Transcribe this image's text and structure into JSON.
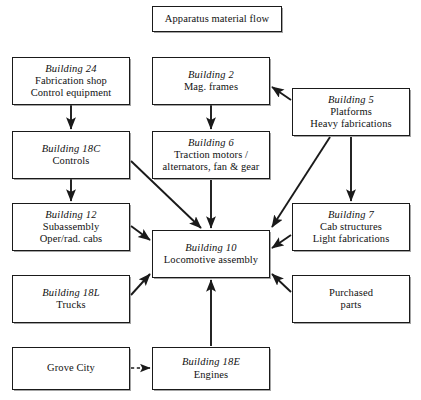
{
  "diagram": {
    "title": "Apparatus material flow",
    "type": "flowchart",
    "background_color": "#ffffff",
    "line_color": "#1a1a1a",
    "nodes": [
      {
        "id": "title",
        "name": "apparatus-material-flow",
        "lines": [
          {
            "text": "Apparatus material flow",
            "style": "plain"
          }
        ],
        "x": 152,
        "y": 6,
        "w": 130,
        "h": 26
      },
      {
        "id": "b24",
        "name": "building-24",
        "lines": [
          {
            "text": "Building 24",
            "style": "italic"
          },
          {
            "text": "Fabrication shop",
            "style": "plain"
          },
          {
            "text": "Control equipment",
            "style": "plain"
          }
        ],
        "x": 12,
        "y": 57,
        "w": 118,
        "h": 48
      },
      {
        "id": "b2",
        "name": "building-2",
        "lines": [
          {
            "text": "Building 2",
            "style": "italic"
          },
          {
            "text": "Mag. frames",
            "style": "plain"
          }
        ],
        "x": 152,
        "y": 57,
        "w": 118,
        "h": 48
      },
      {
        "id": "b5",
        "name": "building-5",
        "lines": [
          {
            "text": "Building 5",
            "style": "italic"
          },
          {
            "text": "Platforms",
            "style": "plain"
          },
          {
            "text": "Heavy fabrications",
            "style": "plain"
          }
        ],
        "x": 292,
        "y": 88,
        "w": 118,
        "h": 48
      },
      {
        "id": "b18c",
        "name": "building-18c",
        "lines": [
          {
            "text": "Building 18C",
            "style": "italic"
          },
          {
            "text": "Controls",
            "style": "plain"
          }
        ],
        "x": 12,
        "y": 131,
        "w": 118,
        "h": 48
      },
      {
        "id": "b6",
        "name": "building-6",
        "lines": [
          {
            "text": "Building 6",
            "style": "italic"
          },
          {
            "text": "Traction motors /",
            "style": "plain"
          },
          {
            "text": "alternators, fan & gear",
            "style": "plain"
          }
        ],
        "x": 152,
        "y": 131,
        "w": 118,
        "h": 48
      },
      {
        "id": "b12",
        "name": "building-12",
        "lines": [
          {
            "text": "Building 12",
            "style": "italic"
          },
          {
            "text": "Subassembly",
            "style": "plain"
          },
          {
            "text": "Oper/rad. cabs",
            "style": "plain"
          }
        ],
        "x": 12,
        "y": 203,
        "w": 118,
        "h": 48
      },
      {
        "id": "b7",
        "name": "building-7",
        "lines": [
          {
            "text": "Building 7",
            "style": "italic"
          },
          {
            "text": "Cab structures",
            "style": "plain"
          },
          {
            "text": "Light fabrications",
            "style": "plain"
          }
        ],
        "x": 292,
        "y": 203,
        "w": 118,
        "h": 48
      },
      {
        "id": "b10",
        "name": "building-10",
        "lines": [
          {
            "text": "Building 10",
            "style": "italic"
          },
          {
            "text": "Locomotive assembly",
            "style": "plain"
          }
        ],
        "x": 152,
        "y": 230,
        "w": 118,
        "h": 48
      },
      {
        "id": "b18l",
        "name": "building-18l",
        "lines": [
          {
            "text": "Building 18L",
            "style": "italic"
          },
          {
            "text": "Trucks",
            "style": "plain"
          }
        ],
        "x": 12,
        "y": 275,
        "w": 118,
        "h": 48
      },
      {
        "id": "purchased",
        "name": "purchased-parts",
        "lines": [
          {
            "text": "Purchased",
            "style": "plain"
          },
          {
            "text": "parts",
            "style": "plain"
          }
        ],
        "x": 292,
        "y": 275,
        "w": 118,
        "h": 48
      },
      {
        "id": "grove",
        "name": "grove-city",
        "lines": [
          {
            "text": "Grove City",
            "style": "plain"
          }
        ],
        "x": 12,
        "y": 347,
        "w": 118,
        "h": 43
      },
      {
        "id": "b18e",
        "name": "building-18e",
        "lines": [
          {
            "text": "Building 18E",
            "style": "italic"
          },
          {
            "text": "Engines",
            "style": "plain"
          }
        ],
        "x": 152,
        "y": 347,
        "w": 118,
        "h": 43
      }
    ],
    "edges": [
      {
        "name": "edge-b24-to-b18c",
        "from": "b24",
        "to": "b18c",
        "style": "solid",
        "points": [
          [
            71,
            105
          ],
          [
            71,
            129
          ]
        ]
      },
      {
        "name": "edge-b2-to-b6",
        "from": "b2",
        "to": "b6",
        "style": "solid",
        "points": [
          [
            211,
            105
          ],
          [
            211,
            129
          ]
        ]
      },
      {
        "name": "edge-b5-to-b2",
        "from": "b5",
        "to": "b2",
        "style": "solid",
        "points": [
          [
            291,
            100
          ],
          [
            272,
            87
          ]
        ]
      },
      {
        "name": "edge-b18c-to-b12",
        "from": "b18c",
        "to": "b12",
        "style": "solid",
        "points": [
          [
            71,
            179
          ],
          [
            71,
            201
          ]
        ]
      },
      {
        "name": "edge-b5-to-b7",
        "from": "b5",
        "to": "b7",
        "style": "solid",
        "points": [
          [
            351,
            137
          ],
          [
            351,
            201
          ]
        ]
      },
      {
        "name": "edge-b18c-to-b10",
        "from": "b18c",
        "to": "b10",
        "style": "solid",
        "points": [
          [
            131,
            161
          ],
          [
            201,
            228
          ]
        ]
      },
      {
        "name": "edge-b5-to-b10",
        "from": "b5",
        "to": "b10",
        "style": "solid",
        "points": [
          [
            330,
            137
          ],
          [
            272,
            227
          ]
        ]
      },
      {
        "name": "edge-b6-to-b10",
        "from": "b6",
        "to": "b10",
        "style": "solid",
        "points": [
          [
            211,
            180
          ],
          [
            211,
            228
          ]
        ]
      },
      {
        "name": "edge-b12-to-b10",
        "from": "b12",
        "to": "b10",
        "style": "solid",
        "points": [
          [
            131,
            226
          ],
          [
            150,
            240
          ]
        ]
      },
      {
        "name": "edge-b7-to-b10",
        "from": "b7",
        "to": "b10",
        "style": "solid",
        "points": [
          [
            291,
            235
          ],
          [
            272,
            248
          ]
        ]
      },
      {
        "name": "edge-b18l-to-b10",
        "from": "b18l",
        "to": "b10",
        "style": "solid",
        "points": [
          [
            131,
            295
          ],
          [
            150,
            274
          ]
        ]
      },
      {
        "name": "edge-purchased-to-b10",
        "from": "purchased",
        "to": "b10",
        "style": "solid",
        "points": [
          [
            291,
            292
          ],
          [
            272,
            274
          ]
        ]
      },
      {
        "name": "edge-b18e-to-b10",
        "from": "b18e",
        "to": "b10",
        "style": "solid",
        "points": [
          [
            211,
            346
          ],
          [
            211,
            280
          ]
        ]
      },
      {
        "name": "edge-grove-to-b18e",
        "from": "grove",
        "to": "b18e",
        "style": "dashed",
        "points": [
          [
            131,
            368
          ],
          [
            150,
            368
          ]
        ]
      }
    ]
  }
}
